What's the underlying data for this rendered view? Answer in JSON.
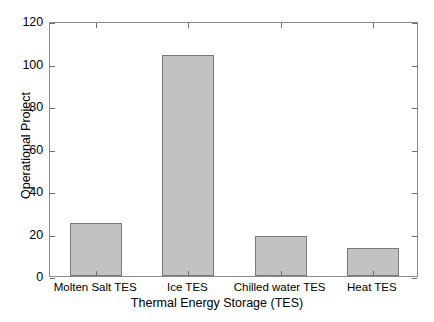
{
  "chart_data": {
    "type": "bar",
    "title": "",
    "subtitle": "",
    "categories": [
      "Molten Salt TES",
      "Ice TES",
      "Chilled water TES",
      "Heat TES"
    ],
    "values": [
      25,
      104,
      19,
      13
    ],
    "xlabel": "Thermal Energy Storage (TES)",
    "ylabel": "Operational Project",
    "ylim": [
      0,
      120
    ],
    "yticks": [
      0,
      20,
      40,
      60,
      80,
      100,
      120
    ],
    "ytick_labels": [
      "0",
      "20",
      "40",
      "60",
      "80",
      "100",
      "120"
    ],
    "grid": false,
    "legend": null,
    "legend_position": "none",
    "annotations": [],
    "series": [
      {
        "name": "Operational Project",
        "values": [
          25,
          104,
          19,
          13
        ],
        "bar_fill_color": "#c2c2c2",
        "bar_edge_color": "#7a7a7a"
      }
    ],
    "colors": {
      "background": "#ffffff",
      "axis": "#8a8a8a",
      "text": "#000000",
      "bar_fill": "#c2c2c2",
      "bar_edge": "#7a7a7a"
    }
  }
}
